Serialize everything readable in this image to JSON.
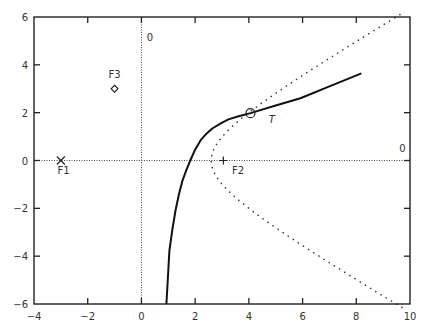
{
  "chart_data": {
    "type": "line",
    "title": "",
    "xlabel": "",
    "ylabel": "",
    "xlim": [
      -4,
      10
    ],
    "ylim": [
      -6,
      6
    ],
    "grid": false,
    "legend": null,
    "x_ticks": [
      -4,
      -2,
      0,
      2,
      4,
      6,
      8,
      10
    ],
    "y_ticks": [
      -6,
      -4,
      -2,
      0,
      2,
      4,
      6
    ],
    "x_tick_labels": [
      "−4",
      "−2",
      "0",
      "2",
      "4",
      "6",
      "8",
      "10"
    ],
    "y_tick_labels": [
      "−6",
      "−4",
      "−2",
      "0",
      "2",
      "4",
      "6"
    ],
    "reference_lines": [
      {
        "name": "horizontal-zero-line",
        "orientation": "horizontal",
        "value": 0,
        "style": "dotted",
        "label": "0",
        "label_pos": [
          9.6,
          0.35
        ]
      },
      {
        "name": "vertical-zero-line",
        "orientation": "vertical",
        "value": 0,
        "style": "dotted",
        "label": "0",
        "label_pos": [
          0.2,
          5.0
        ]
      }
    ],
    "series": [
      {
        "name": "solid-curve",
        "style": "solid",
        "color": "#111111",
        "points": [
          [
            0.93,
            -6.0
          ],
          [
            1.0,
            -4.6
          ],
          [
            1.04,
            -3.77
          ],
          [
            1.15,
            -2.9
          ],
          [
            1.27,
            -2.09
          ],
          [
            1.4,
            -1.4
          ],
          [
            1.53,
            -0.84
          ],
          [
            1.67,
            -0.4
          ],
          [
            1.82,
            0.0
          ],
          [
            2.0,
            0.45
          ],
          [
            2.2,
            0.84
          ],
          [
            2.42,
            1.12
          ],
          [
            2.64,
            1.34
          ],
          [
            2.95,
            1.55
          ],
          [
            3.24,
            1.72
          ],
          [
            3.65,
            1.86
          ],
          [
            4.06,
            1.98
          ],
          [
            5.0,
            2.3
          ],
          [
            5.92,
            2.6
          ],
          [
            7.0,
            3.1
          ],
          [
            8.19,
            3.64
          ]
        ]
      },
      {
        "name": "dotted-hyperbola",
        "style": "dotted",
        "color": "#333333",
        "hyperbola": {
          "a": 2.6,
          "b": 1.71,
          "center": [
            0,
            0
          ]
        },
        "x_range": [
          2.6,
          9.7
        ]
      }
    ],
    "markers": [
      {
        "name": "F1",
        "label": "F1",
        "symbol": "x",
        "x": -3.0,
        "y": 0.0,
        "label_pos": [
          -2.9,
          -0.55
        ]
      },
      {
        "name": "F2",
        "label": "F2",
        "symbol": "+",
        "x": 3.05,
        "y": 0.0,
        "label_pos": [
          3.6,
          -0.55
        ]
      },
      {
        "name": "F3",
        "label": "F3",
        "symbol": "diamond",
        "x": -1.0,
        "y": 3.0,
        "label_pos": [
          -1.0,
          3.45
        ]
      },
      {
        "name": "T",
        "label": "T",
        "symbol": "circle",
        "x": 4.06,
        "y": 1.98,
        "label_pos": [
          4.85,
          1.55
        ],
        "label_italic": true
      }
    ]
  }
}
